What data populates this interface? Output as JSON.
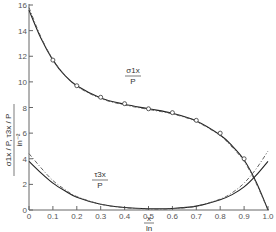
{
  "chart_data": {
    "type": "line",
    "title": "",
    "xlabel": "x/l_n",
    "ylabel": "σ1x/P, τ3x/P  (in⁻²)",
    "xlim": [
      0,
      1.0
    ],
    "ylim": [
      0,
      16
    ],
    "grid": false,
    "x_ticks": [
      "0",
      "0.1",
      "0.2",
      "0.3",
      "0.4",
      "0.5",
      "0.6",
      "0.7",
      "0.8",
      "0.9",
      "1.0"
    ],
    "y_ticks": [
      "0",
      "2",
      "4",
      "6",
      "8",
      "10",
      "12",
      "14",
      "16"
    ],
    "x_tick_values": [
      0,
      0.1,
      0.2,
      0.3,
      0.4,
      0.5,
      0.6,
      0.7,
      0.8,
      0.9,
      1.0
    ],
    "y_tick_values": [
      0,
      2,
      4,
      6,
      8,
      10,
      12,
      14,
      16
    ],
    "series": [
      {
        "name": "σ1x/P (solid)",
        "style": "solid",
        "x": [
          0,
          0.05,
          0.1,
          0.15,
          0.2,
          0.3,
          0.4,
          0.5,
          0.6,
          0.7,
          0.8,
          0.85,
          0.9,
          0.95,
          1.0
        ],
        "values": [
          15.6,
          13.4,
          11.7,
          10.5,
          9.7,
          8.75,
          8.25,
          7.9,
          7.55,
          6.95,
          5.85,
          5.0,
          3.9,
          2.2,
          0.0
        ]
      },
      {
        "name": "σ1x/P (dashed)",
        "style": "dashed",
        "x": [
          0,
          0.05,
          0.1,
          0.15,
          0.2,
          0.3,
          0.4,
          0.5,
          0.6,
          0.7,
          0.8,
          0.85,
          0.9,
          0.95,
          1.0
        ],
        "values": [
          15.8,
          13.5,
          11.75,
          10.5,
          9.65,
          8.7,
          8.2,
          7.85,
          7.5,
          6.9,
          5.8,
          4.9,
          3.8,
          2.1,
          0.0
        ]
      },
      {
        "name": "σ1x/P (measured)",
        "style": "markers",
        "x": [
          0.1,
          0.2,
          0.3,
          0.4,
          0.5,
          0.6,
          0.7,
          0.8,
          0.9
        ],
        "values": [
          11.7,
          9.7,
          8.8,
          8.3,
          7.9,
          7.6,
          7.0,
          6.0,
          4.0
        ]
      },
      {
        "name": "τ3x/P (solid)",
        "style": "solid",
        "x": [
          0,
          0.05,
          0.1,
          0.15,
          0.2,
          0.3,
          0.4,
          0.5,
          0.6,
          0.7,
          0.8,
          0.85,
          0.9,
          0.95,
          1.0
        ],
        "values": [
          3.8,
          2.9,
          2.1,
          1.5,
          1.0,
          0.45,
          0.2,
          0.1,
          0.12,
          0.3,
          0.8,
          1.2,
          1.8,
          2.7,
          3.8
        ]
      },
      {
        "name": "τ3x/P (dashed)",
        "style": "dashed",
        "x": [
          0,
          0.05,
          0.1,
          0.15,
          0.2,
          0.3,
          0.4,
          0.5,
          0.6,
          0.7,
          0.8,
          0.85,
          0.9,
          0.95,
          1.0
        ],
        "values": [
          4.4,
          3.3,
          2.3,
          1.6,
          1.05,
          0.45,
          0.18,
          0.08,
          0.1,
          0.3,
          0.85,
          1.35,
          2.1,
          3.2,
          4.6
        ]
      }
    ],
    "annotations": [
      {
        "text_num": "σ1x",
        "text_den": "P",
        "x": 0.43,
        "y": 10.2
      },
      {
        "text_num": "τ3x",
        "text_den": "P",
        "x": 0.3,
        "y": 2.2
      }
    ]
  },
  "labels": {
    "ylabel_num": "σ1x / P, τ3x / P",
    "ylabel_den": "in⁻²",
    "xlabel_num": "x",
    "xlabel_den": "ln",
    "ann1_num": "σ1x",
    "ann1_den": "P",
    "ann2_num": "τ3x",
    "ann2_den": "P"
  }
}
